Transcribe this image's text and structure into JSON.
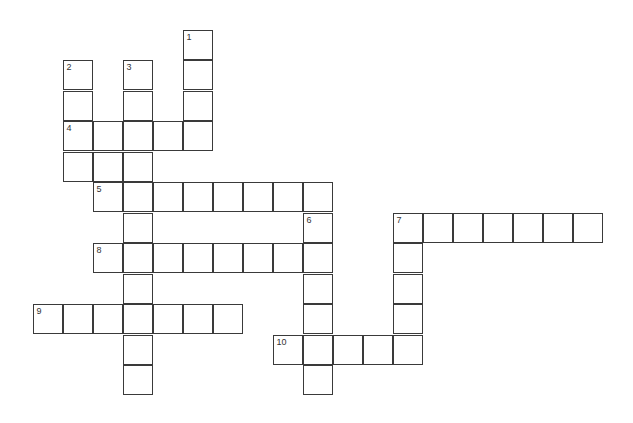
{
  "puzzle": {
    "type": "crossword",
    "cell_size": 30,
    "origin": {
      "x": 33,
      "y": 30
    },
    "row_step": 30.45,
    "clues": [
      {
        "number": "1",
        "direction": "down",
        "row": 0,
        "col": 5,
        "length": 4
      },
      {
        "number": "2",
        "direction": "down",
        "row": 1,
        "col": 1,
        "length": 4
      },
      {
        "number": "3",
        "direction": "down",
        "row": 1,
        "col": 3,
        "length": 11
      },
      {
        "number": "4",
        "direction": "across",
        "row": 3,
        "col": 1,
        "length": 5
      },
      {
        "number": "5",
        "direction": "across",
        "row": 5,
        "col": 2,
        "length": 8
      },
      {
        "number": "6",
        "direction": "down",
        "row": 6,
        "col": 9,
        "length": 6
      },
      {
        "number": "7",
        "direction": "across",
        "row": 6,
        "col": 12,
        "length": 7
      },
      {
        "number": "7",
        "direction": "down",
        "row": 6,
        "col": 12,
        "length": 5
      },
      {
        "number": "8",
        "direction": "across",
        "row": 7,
        "col": 2,
        "length": 8
      },
      {
        "number": "9",
        "direction": "across",
        "row": 9,
        "col": 0,
        "length": 7
      },
      {
        "number": "10",
        "direction": "across",
        "row": 10,
        "col": 8,
        "length": 5
      }
    ],
    "extra_cells": [
      {
        "row": 4,
        "col": 1
      },
      {
        "row": 4,
        "col": 2
      },
      {
        "row": 4,
        "col": 3
      }
    ]
  }
}
